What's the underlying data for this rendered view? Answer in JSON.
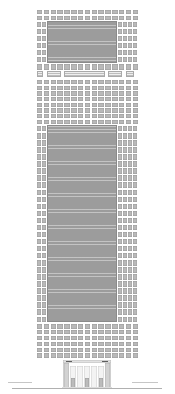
{
  "drawing": {
    "type": "architectural-elevation",
    "subject": "high-rise office tower front elevation",
    "canvas": {
      "width": 175,
      "height": 394
    },
    "background_color": "#ffffff",
    "line_color": "#c8c8c8"
  },
  "palette": {
    "window": "#b9b9b9",
    "window_light": "#c4c4c4",
    "glass_panel": "#9c9c9c",
    "glass_border": "#8a8a8a",
    "louver": "#bdbdbd",
    "pier": "#d2d2d2",
    "bay": "#f3f3f3",
    "lintel": "#5d5d5d",
    "ground": "#b0b0b0"
  },
  "building": {
    "left": 36,
    "top": 8,
    "width": 103,
    "height": 380,
    "label": "tower-elevation"
  },
  "sections": [
    {
      "id": "crown",
      "label": "Crown / upper window band",
      "top": 10,
      "height": 10,
      "columns": 15,
      "rows": 2,
      "tone": "window"
    },
    {
      "id": "upper-glazed-panel",
      "label": "Upper glazed curtain-wall panel",
      "left": 11,
      "top": 20,
      "width": 70,
      "height": 42,
      "tone": "glass_panel"
    },
    {
      "id": "upper-left-windows",
      "label": "Upper left window bank",
      "left": 1,
      "top": 20,
      "width": 10,
      "height": 42,
      "columns": 2,
      "rows": 6
    },
    {
      "id": "upper-right-windows",
      "label": "Upper right window bank",
      "left": 81,
      "top": 20,
      "width": 20,
      "height": 42,
      "columns": 4,
      "rows": 6
    },
    {
      "id": "mech-louver-band",
      "label": "Mechanical floor louver band",
      "top": 71,
      "height": 6,
      "tone": "louver"
    },
    {
      "id": "mid-upper-grid",
      "label": "Mid-upper punched window grid",
      "top": 79,
      "height": 44,
      "columns": 15,
      "rows": 8
    },
    {
      "id": "main-glazed-panel",
      "label": "Main tower glazed curtain wall",
      "left": 11,
      "top": 125,
      "width": 70,
      "height": 196,
      "tone": "glass_panel"
    },
    {
      "id": "main-left-windows",
      "label": "Tower left window bank",
      "left": 1,
      "top": 125,
      "width": 10,
      "height": 196,
      "columns": 2,
      "rows": 28
    },
    {
      "id": "main-right-windows",
      "label": "Tower right window bank",
      "left": 81,
      "top": 125,
      "width": 20,
      "height": 196,
      "columns": 4,
      "rows": 28
    },
    {
      "id": "lower-grid",
      "label": "Lower punched window grid",
      "top": 322,
      "height": 33,
      "columns": 15,
      "rows": 6
    },
    {
      "id": "podium",
      "label": "Podium colonnade and entrance",
      "top": 358,
      "height": 30
    }
  ],
  "podium": {
    "label": "Entrance podium",
    "piers": 2,
    "bays": 5,
    "doors": 3,
    "lintels": 2,
    "cornice_label": "podium cornice"
  },
  "ground": {
    "label": "Ground line",
    "y": 388,
    "left": 12,
    "width": 150
  }
}
